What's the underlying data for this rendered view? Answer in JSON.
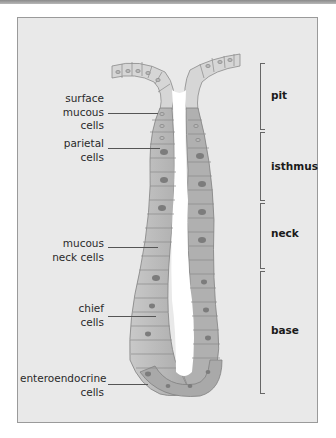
{
  "diagram": {
    "type": "gastric gland cross-section",
    "colors": {
      "frame_bg": "#e9e9e9",
      "frame_border": "#9a9a9a",
      "cell_light": "#d4d4d4",
      "cell_mid": "#b4b4b4",
      "cell_dark": "#8f8f8f",
      "nucleus": "#a8a8a8",
      "lumen": "#ffffff"
    }
  },
  "cell_labels": [
    {
      "id": "surface-mucous",
      "text": "surface\nmucous\ncells"
    },
    {
      "id": "parietal",
      "text": "parietal\ncells"
    },
    {
      "id": "mucous-neck",
      "text": "mucous\nneck cells"
    },
    {
      "id": "chief",
      "text": "chief\ncells"
    },
    {
      "id": "enteroendocrine",
      "text": "enteroendocrine\ncells"
    }
  ],
  "regions": [
    {
      "id": "pit",
      "text": "pit"
    },
    {
      "id": "isthmus",
      "text": "isthmus"
    },
    {
      "id": "neck",
      "text": "neck"
    },
    {
      "id": "base",
      "text": "base"
    }
  ]
}
